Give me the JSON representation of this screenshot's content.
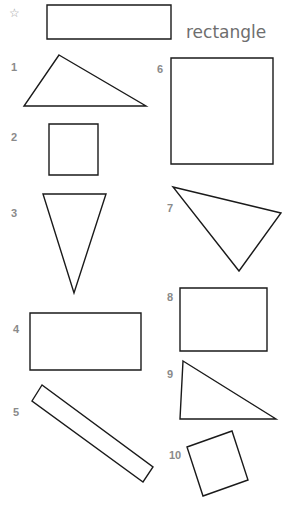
{
  "example": {
    "marker": "☆",
    "word": "rectangle"
  },
  "shapes": [
    {
      "number": "1",
      "type": "triangle"
    },
    {
      "number": "2",
      "type": "square"
    },
    {
      "number": "3",
      "type": "triangle"
    },
    {
      "number": "4",
      "type": "rectangle"
    },
    {
      "number": "5",
      "type": "rectangle"
    },
    {
      "number": "6",
      "type": "square"
    },
    {
      "number": "7",
      "type": "triangle"
    },
    {
      "number": "8",
      "type": "rectangle"
    },
    {
      "number": "9",
      "type": "triangle"
    },
    {
      "number": "10",
      "type": "square"
    }
  ],
  "colors": {
    "stroke": "#1a1a1a",
    "label": "#8a8a8a",
    "word": "#6e6e6e"
  }
}
